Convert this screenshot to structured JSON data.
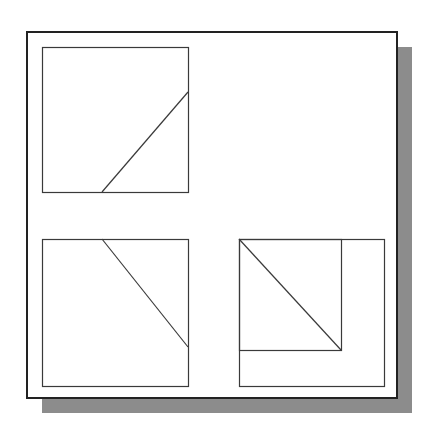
{
  "figure": {
    "background": "#ffffff",
    "stroke": "#3a3a3a",
    "frame": {
      "x": 27,
      "y": 32,
      "width": 370,
      "height": 366,
      "stroke_width": 2,
      "color": "#222222"
    },
    "shadow": {
      "offset": 15,
      "color": "#8c8c8c"
    },
    "panels": [
      {
        "id": "top-left",
        "box": {
          "x": 42,
          "y": 47,
          "width": 146,
          "height": 145
        },
        "lines": [
          {
            "x1": 102,
            "y1": 192,
            "x2": 188,
            "y2": 92
          }
        ],
        "inner_rects": []
      },
      {
        "id": "bottom-left",
        "box": {
          "x": 42,
          "y": 239,
          "width": 146,
          "height": 147
        },
        "lines": [
          {
            "x1": 102,
            "y1": 239,
            "x2": 188,
            "y2": 347
          }
        ],
        "inner_rects": []
      },
      {
        "id": "bottom-right",
        "box": {
          "x": 239,
          "y": 239,
          "width": 145,
          "height": 147
        },
        "lines": [
          {
            "x1": 239,
            "y1": 239,
            "x2": 341,
            "y2": 350
          }
        ],
        "inner_rects": [
          {
            "x": 239,
            "y": 239,
            "width": 102,
            "height": 111
          }
        ]
      }
    ]
  }
}
